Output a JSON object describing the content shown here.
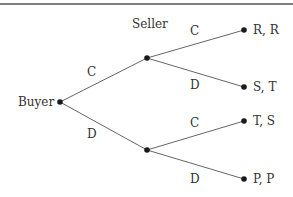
{
  "diagram": {
    "type": "game-tree",
    "colors": {
      "line": "#666666",
      "node": "#1a1a1a",
      "text": "#333333",
      "top_rule": "#555555"
    },
    "players": {
      "root": "Buyer",
      "second": "Seller"
    },
    "nodes": {
      "buyer": {
        "x": 60,
        "y": 102,
        "label": "Buyer"
      },
      "seller_top": {
        "x": 147,
        "y": 58,
        "label": "Seller"
      },
      "seller_bottom": {
        "x": 147,
        "y": 150
      },
      "leaf_1": {
        "x": 244,
        "y": 30,
        "label": "R, R"
      },
      "leaf_2": {
        "x": 244,
        "y": 87,
        "label": "S, T"
      },
      "leaf_3": {
        "x": 244,
        "y": 121,
        "label": "T, S"
      },
      "leaf_4": {
        "x": 244,
        "y": 179,
        "label": "P, P"
      }
    },
    "edges": [
      {
        "from": "buyer",
        "to": "seller_top",
        "label": "C"
      },
      {
        "from": "buyer",
        "to": "seller_bottom",
        "label": "D"
      },
      {
        "from": "seller_top",
        "to": "leaf_1",
        "label": "C"
      },
      {
        "from": "seller_top",
        "to": "leaf_2",
        "label": "D"
      },
      {
        "from": "seller_bottom",
        "to": "leaf_3",
        "label": "C"
      },
      {
        "from": "seller_bottom",
        "to": "leaf_4",
        "label": "D"
      }
    ]
  }
}
